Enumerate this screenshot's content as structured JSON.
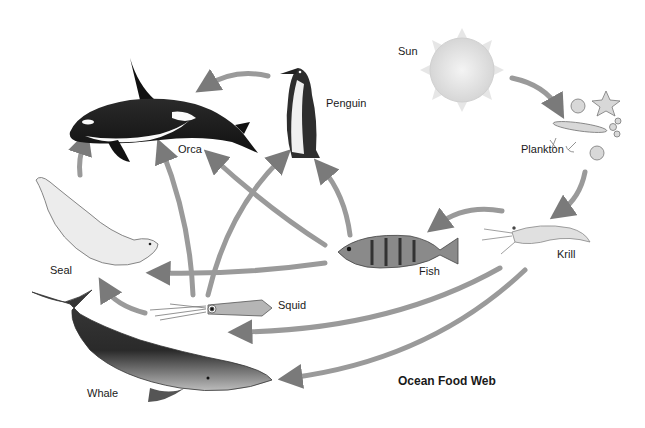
{
  "title": "Ocean Food Web",
  "organisms": {
    "sun": {
      "label": "Sun"
    },
    "plankton": {
      "label": "Plankton"
    },
    "krill": {
      "label": "Krill"
    },
    "fish": {
      "label": "Fish"
    },
    "squid": {
      "label": "Squid"
    },
    "penguin": {
      "label": "Penguin"
    },
    "orca": {
      "label": "Orca"
    },
    "seal": {
      "label": "Seal"
    },
    "whale": {
      "label": "Whale"
    }
  },
  "links": [
    {
      "from": "Sun",
      "to": "Plankton"
    },
    {
      "from": "Plankton",
      "to": "Krill"
    },
    {
      "from": "Krill",
      "to": "Fish"
    },
    {
      "from": "Krill",
      "to": "Squid"
    },
    {
      "from": "Krill",
      "to": "Whale"
    },
    {
      "from": "Fish",
      "to": "Seal"
    },
    {
      "from": "Fish",
      "to": "Penguin"
    },
    {
      "from": "Fish",
      "to": "Orca"
    },
    {
      "from": "Squid",
      "to": "Seal"
    },
    {
      "from": "Squid",
      "to": "Orca"
    },
    {
      "from": "Squid",
      "to": "Penguin"
    },
    {
      "from": "Seal",
      "to": "Orca"
    },
    {
      "from": "Penguin",
      "to": "Orca"
    }
  ],
  "colors": {
    "arrow": "#8a8a8a",
    "background": "#ffffff",
    "text": "#1a1a1a"
  }
}
